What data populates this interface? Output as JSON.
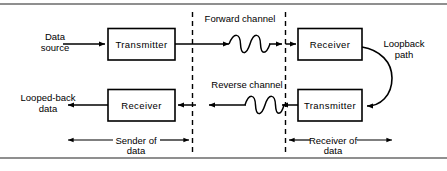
{
  "figure": {
    "boxes": {
      "top_transmitter": "Transmitter",
      "top_receiver": "Receiver",
      "bottom_receiver": "Receiver",
      "bottom_transmitter": "Transmitter"
    },
    "endpoints": {
      "data_source_line1": "Data",
      "data_source_line2": "source",
      "looped_back_line1": "Looped-back",
      "looped_back_line2": "data"
    },
    "channels": {
      "forward": "Forward channel",
      "reverse": "Reverse channel"
    },
    "loopback": {
      "line1": "Loopback",
      "line2": "path"
    },
    "spans": {
      "sender_line1": "Sender of",
      "sender_line2": "data",
      "receiver_line1": "Receiver of",
      "receiver_line2": "data"
    },
    "colors": {
      "ink": "#000000",
      "rule": "#8f8f8f",
      "background": "#ffffff"
    }
  }
}
